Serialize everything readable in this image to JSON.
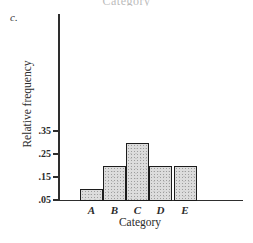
{
  "page": {
    "background": "#ffffff",
    "part_label": "c.",
    "clipped_top_text": "Category"
  },
  "chart_data": {
    "type": "bar",
    "title": "",
    "categories": [
      "A",
      "B",
      "C",
      "D",
      "E"
    ],
    "values": [
      0.1,
      0.2,
      0.3,
      0.2,
      0.2
    ],
    "xlabel": "Category",
    "ylabel": "Relative frequency",
    "yticks": [
      0.35,
      0.25,
      0.15,
      0.05
    ],
    "ytick_labels": [
      ".35",
      ".25",
      ".15",
      ".05"
    ],
    "ylim": [
      0.05,
      0.86
    ],
    "grid": false,
    "legend_position": "none",
    "bar_fill": "#dcdcdc",
    "bar_stipple": "#9d9d9d",
    "bar_border": "#1c1c1c",
    "axis_color": "#2e2e2e"
  }
}
